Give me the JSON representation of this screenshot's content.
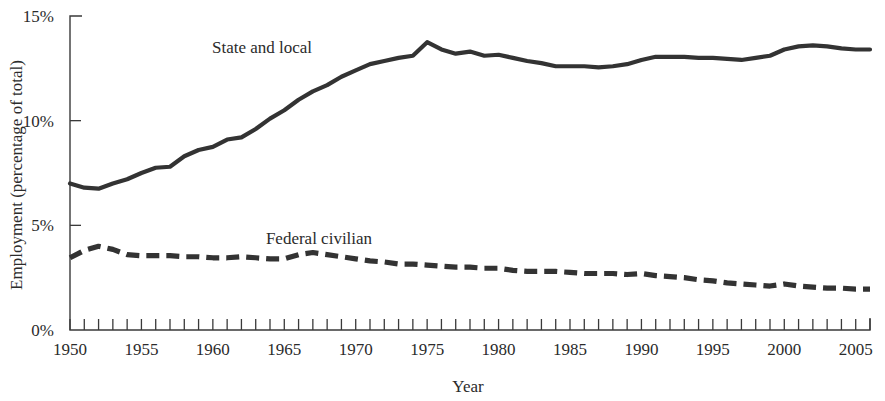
{
  "chart_data": {
    "type": "line",
    "title": "",
    "xlabel": "Year",
    "ylabel": "Employment (percentage of total)",
    "xlim": [
      1950,
      2006
    ],
    "ylim": [
      0,
      15
    ],
    "grid": false,
    "legend_position": "inline-annotation",
    "y_ticks": [
      0,
      5,
      10,
      15
    ],
    "y_tick_labels": [
      "0%",
      "5%",
      "10%",
      "15%"
    ],
    "x_ticks": [
      1950,
      1951,
      1952,
      1953,
      1954,
      1955,
      1956,
      1957,
      1958,
      1959,
      1960,
      1961,
      1962,
      1963,
      1964,
      1965,
      1966,
      1967,
      1968,
      1969,
      1970,
      1971,
      1972,
      1973,
      1974,
      1975,
      1976,
      1977,
      1978,
      1979,
      1980,
      1981,
      1982,
      1983,
      1984,
      1985,
      1986,
      1987,
      1988,
      1989,
      1990,
      1991,
      1992,
      1993,
      1994,
      1995,
      1996,
      1997,
      1998,
      1999,
      2000,
      2001,
      2002,
      2003,
      2004,
      2005,
      2006
    ],
    "x_tick_labels": [
      "1950",
      "1955",
      "1960",
      "1965",
      "1970",
      "1975",
      "1980",
      "1985",
      "1990",
      "1995",
      "2000",
      "2005"
    ],
    "x_labeled_ticks": [
      1950,
      1955,
      1960,
      1965,
      1970,
      1975,
      1980,
      1985,
      1990,
      1995,
      2000,
      2005
    ],
    "x": [
      1950,
      1951,
      1952,
      1953,
      1954,
      1955,
      1956,
      1957,
      1958,
      1959,
      1960,
      1961,
      1962,
      1963,
      1964,
      1965,
      1966,
      1967,
      1968,
      1969,
      1970,
      1971,
      1972,
      1973,
      1974,
      1975,
      1976,
      1977,
      1978,
      1979,
      1980,
      1981,
      1982,
      1983,
      1984,
      1985,
      1986,
      1987,
      1988,
      1989,
      1990,
      1991,
      1992,
      1993,
      1994,
      1995,
      1996,
      1997,
      1998,
      1999,
      2000,
      2001,
      2002,
      2003,
      2004,
      2005,
      2006
    ],
    "series": [
      {
        "name": "State and local",
        "style": "solid",
        "color": "#333333",
        "annotation": "State and local",
        "values": [
          7.0,
          6.8,
          6.75,
          7.0,
          7.2,
          7.5,
          7.75,
          7.8,
          8.3,
          8.6,
          8.75,
          9.1,
          9.2,
          9.6,
          10.1,
          10.5,
          11.0,
          11.4,
          11.7,
          12.1,
          12.4,
          12.7,
          12.85,
          13.0,
          13.1,
          13.75,
          13.4,
          13.2,
          13.3,
          13.1,
          13.15,
          13.0,
          12.85,
          12.75,
          12.6,
          12.6,
          12.6,
          12.55,
          12.6,
          12.7,
          12.9,
          13.05,
          13.05,
          13.05,
          13.0,
          13.0,
          12.95,
          12.9,
          13.0,
          13.1,
          13.4,
          13.55,
          13.6,
          13.55,
          13.45,
          13.4,
          13.4
        ]
      },
      {
        "name": "Federal civilian",
        "style": "dashed",
        "color": "#333333",
        "annotation": "Federal civilian",
        "values": [
          3.45,
          3.8,
          4.0,
          3.85,
          3.6,
          3.55,
          3.55,
          3.55,
          3.5,
          3.5,
          3.45,
          3.45,
          3.5,
          3.45,
          3.4,
          3.4,
          3.6,
          3.7,
          3.6,
          3.5,
          3.4,
          3.3,
          3.25,
          3.15,
          3.15,
          3.1,
          3.05,
          3.0,
          3.0,
          2.95,
          2.95,
          2.85,
          2.8,
          2.8,
          2.8,
          2.75,
          2.7,
          2.7,
          2.7,
          2.65,
          2.7,
          2.6,
          2.55,
          2.5,
          2.4,
          2.35,
          2.25,
          2.2,
          2.15,
          2.1,
          2.2,
          2.1,
          2.05,
          2.0,
          2.0,
          1.95,
          1.95
        ]
      }
    ],
    "annotations": [
      {
        "label": "State and local",
        "x_px": 262,
        "y_px": 53
      },
      {
        "label": "Federal civilian",
        "x_px": 319,
        "y_px": 244
      }
    ]
  },
  "colors": {
    "axis": "#3a3a3a",
    "line": "#333333",
    "text": "#2b2b2b",
    "background": "#ffffff"
  }
}
